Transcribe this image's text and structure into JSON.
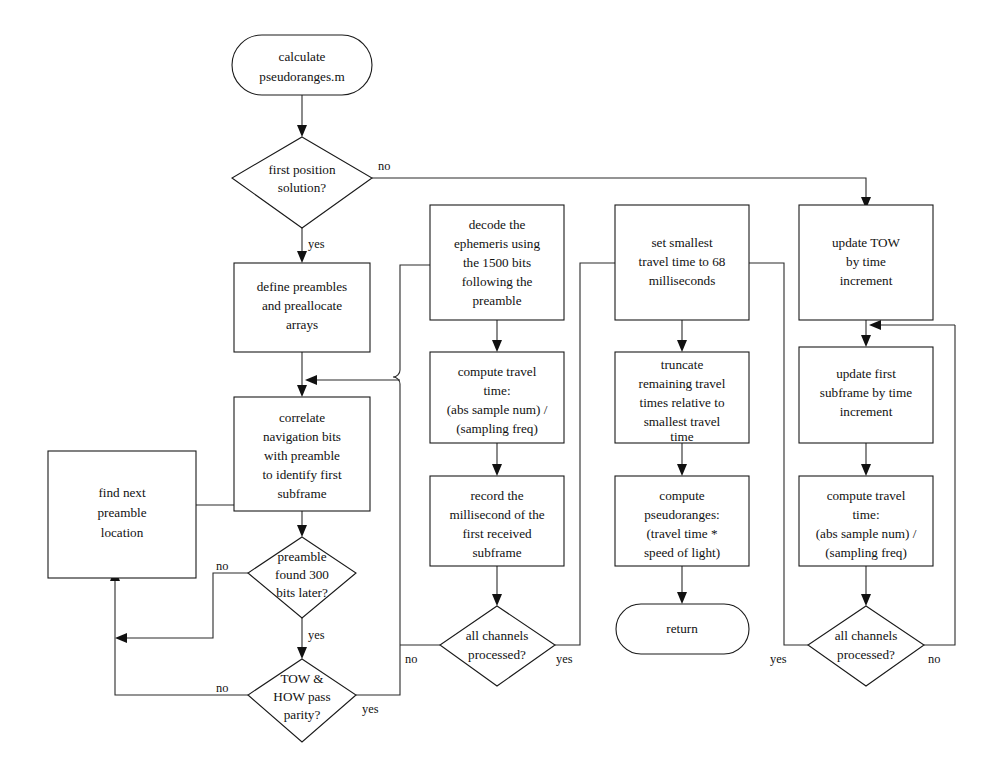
{
  "diagram": {
    "colors": {
      "stroke": "#1a1a1a",
      "connector": "#2b2b2b",
      "text": "#111111",
      "background": "#ffffff"
    },
    "nodes": {
      "start": {
        "shape": "terminator",
        "lines": [
          "calculate",
          "pseudoranges.m"
        ]
      },
      "first_position_solution": {
        "shape": "decision",
        "lines": [
          "first position",
          "solution?"
        ]
      },
      "define_preambles": {
        "shape": "process",
        "lines": [
          "define preambles",
          "and preallocate",
          "arrays"
        ]
      },
      "correlate_navigation_bits": {
        "shape": "process",
        "lines": [
          "correlate",
          "navigation bits",
          "with preamble",
          "to identify first",
          "subframe"
        ]
      },
      "find_next_preamble": {
        "shape": "process",
        "lines": [
          "find next",
          "preamble",
          "location"
        ]
      },
      "preamble_found_300": {
        "shape": "decision",
        "lines": [
          "preamble",
          "found 300",
          "bits later?"
        ]
      },
      "tow_how_parity": {
        "shape": "decision",
        "lines": [
          "TOW &",
          "HOW pass",
          "parity?"
        ]
      },
      "decode_ephemeris": {
        "shape": "process",
        "lines": [
          "decode the",
          "ephemeris using",
          "the 1500 bits",
          "following the",
          "preamble"
        ]
      },
      "compute_travel_time_a": {
        "shape": "process",
        "lines": [
          "compute travel",
          "time:",
          "(abs sample num) /",
          "(sampling freq)"
        ]
      },
      "record_millisecond": {
        "shape": "process",
        "lines": [
          "record the",
          "millisecond of the",
          "first received",
          "subframe"
        ]
      },
      "all_channels_processed_a": {
        "shape": "decision",
        "lines": [
          "all channels",
          "processed?"
        ]
      },
      "set_smallest_travel_time": {
        "shape": "process",
        "lines": [
          "set smallest",
          "travel time to 68",
          "milliseconds"
        ]
      },
      "truncate_remaining": {
        "shape": "process",
        "lines": [
          "truncate",
          "remaining travel",
          "times relative to",
          "smallest travel",
          "time"
        ]
      },
      "compute_pseudoranges": {
        "shape": "process",
        "lines": [
          "compute",
          "pseudoranges:",
          "(travel time *",
          "speed of light)"
        ]
      },
      "return": {
        "shape": "terminator",
        "lines": [
          "return"
        ]
      },
      "update_tow": {
        "shape": "process",
        "lines": [
          "update TOW",
          "by time",
          "increment"
        ]
      },
      "update_first_subframe": {
        "shape": "process",
        "lines": [
          "update first",
          "subframe by time",
          "increment"
        ]
      },
      "compute_travel_time_b": {
        "shape": "process",
        "lines": [
          "compute travel",
          "time:",
          "(abs sample num) /",
          "(sampling freq)"
        ]
      },
      "all_channels_processed_b": {
        "shape": "decision",
        "lines": [
          "all channels",
          "processed?"
        ]
      }
    },
    "edge_labels": {
      "first_position_no": "no",
      "first_position_yes": "yes",
      "preamble_found_no": "no",
      "preamble_found_yes": "yes",
      "tow_how_no": "no",
      "tow_how_yes": "yes",
      "channels_a_no": "no",
      "channels_a_yes": "yes",
      "channels_b_yes": "yes",
      "channels_b_no": "no"
    }
  }
}
